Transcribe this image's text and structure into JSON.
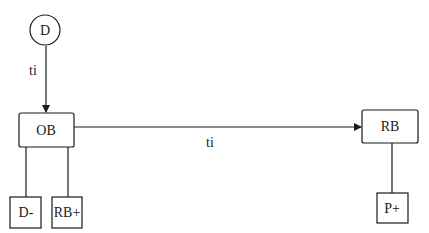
{
  "diagram": {
    "nodes": [
      {
        "id": "D",
        "label": "D",
        "shape": "circle"
      },
      {
        "id": "OB",
        "label": "OB",
        "shape": "rect"
      },
      {
        "id": "RB",
        "label": "RB",
        "shape": "rect"
      },
      {
        "id": "Dminus",
        "label": "D-",
        "shape": "rect"
      },
      {
        "id": "RBplus",
        "label": "RB+",
        "shape": "rect"
      },
      {
        "id": "Pplus",
        "label": "P+",
        "shape": "rect"
      }
    ],
    "edges": [
      {
        "from": "D",
        "to": "OB",
        "label": "ti",
        "arrow": true
      },
      {
        "from": "OB",
        "to": "RB",
        "label": "ti",
        "arrow": true
      },
      {
        "from": "OB",
        "to": "D-",
        "label": "",
        "arrow": false
      },
      {
        "from": "OB",
        "to": "RB+",
        "label": "",
        "arrow": false
      },
      {
        "from": "RB",
        "to": "P+",
        "label": "",
        "arrow": false
      }
    ]
  },
  "colors": {
    "stroke": "#1a1a1a",
    "background": "#ffffff"
  }
}
